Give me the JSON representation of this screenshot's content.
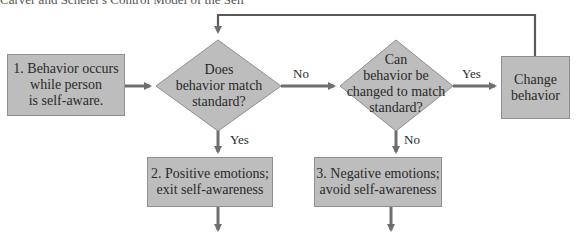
{
  "caption": "Carver and Scheier's Control Model of the Self",
  "nodes": {
    "start": "1. Behavior occurs\nwhile person\nis self-aware.",
    "decision_match": "Does\nbehavior match\nstandard?",
    "decision_change": "Can\nbehavior be\nchanged to match\nstandard?",
    "change": "Change\nbehavior",
    "positive": "2. Positive emotions;\nexit self-awareness",
    "negative": "3. Negative emotions;\navoid self-awareness"
  },
  "edges": {
    "match_no": "No",
    "match_yes": "Yes",
    "change_yes": "Yes",
    "change_no": "No"
  },
  "colors": {
    "box_fill": "#bdbdbd",
    "arrow": "#6e6e6e",
    "line": "#5a5a5a"
  }
}
